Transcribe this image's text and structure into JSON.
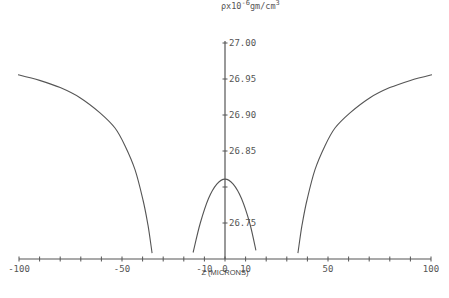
{
  "chart_data": {
    "type": "line",
    "title": "",
    "xlabel": "Z (MICRONS)",
    "ylabel": "ρx10^-6 gm/cm^3",
    "ylabel_parts": {
      "base": "ρx10",
      "exp1": "-6",
      "mid": "gm/cm",
      "exp2": "3"
    },
    "xlim": [
      -100,
      100
    ],
    "ylim": [
      26.7,
      27.0
    ],
    "grid": false,
    "legend": null,
    "x_ticks": [
      -100,
      -90,
      -80,
      -70,
      -60,
      -50,
      -40,
      -30,
      -20,
      -10,
      0,
      10,
      20,
      30,
      40,
      50,
      60,
      70,
      80,
      90,
      100
    ],
    "x_tick_labels": [
      {
        "value": -100,
        "label": "-100"
      },
      {
        "value": -50,
        "label": "-50"
      },
      {
        "value": -10,
        "label": "-10"
      },
      {
        "value": 0,
        "label": "0"
      },
      {
        "value": 10,
        "label": "10"
      },
      {
        "value": 50,
        "label": "50"
      },
      {
        "value": 100,
        "label": "100"
      }
    ],
    "y_ticks": [
      26.75,
      26.8,
      26.85,
      26.9,
      26.95,
      27.0
    ],
    "y_tick_labels": [
      {
        "value": 26.75,
        "label": "26.75"
      },
      {
        "value": 26.85,
        "label": "26.85"
      },
      {
        "value": 26.9,
        "label": "26.90"
      },
      {
        "value": 26.95,
        "label": "26.95"
      },
      {
        "value": 27.0,
        "label": "27.00"
      }
    ],
    "series": [
      {
        "name": "left branch",
        "x": [
          -100.5,
          -90,
          -80,
          -70.4,
          -60.7,
          -53.4,
          -48.5,
          -43.7,
          -39.8,
          -37.4,
          -35.4
        ],
        "y": [
          26.956,
          26.948,
          26.938,
          26.924,
          26.903,
          26.882,
          26.857,
          26.824,
          26.782,
          26.747,
          26.708
        ]
      },
      {
        "name": "central parabola",
        "x": [
          -15.5,
          -12,
          -8,
          -4,
          0,
          4,
          8,
          12,
          15
        ],
        "y": [
          26.709,
          26.75,
          26.784,
          26.804,
          26.811,
          26.804,
          26.784,
          26.75,
          26.712
        ]
      },
      {
        "name": "right branch",
        "x": [
          35.4,
          37.4,
          39.8,
          43.7,
          48.5,
          53.4,
          60.7,
          70.4,
          80,
          90,
          100.5
        ],
        "y": [
          26.708,
          26.747,
          26.782,
          26.824,
          26.857,
          26.882,
          26.903,
          26.924,
          26.938,
          26.948,
          26.956
        ]
      }
    ],
    "colors": {
      "line": "#555555",
      "axis": "#555555",
      "text": "#555555"
    }
  }
}
